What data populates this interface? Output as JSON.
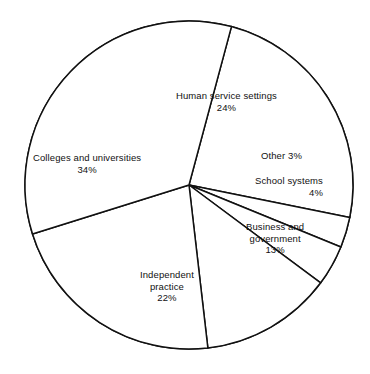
{
  "chart_data": {
    "type": "pie",
    "title": "",
    "subtitle": "",
    "xlabel": "",
    "ylabel": "",
    "legend_position": "none",
    "grid": false,
    "value_unit": "%",
    "total": 100,
    "style": {
      "fill": "#ffffff",
      "stroke": "#111111",
      "stroke_width": 1.5,
      "background": "#ffffff",
      "labels_inside": true
    },
    "geometry": {
      "center_x": 189,
      "center_y": 185,
      "radius": 164,
      "start_angle_deg": -75,
      "direction": "clockwise"
    },
    "categories": [
      "Human service settings",
      "Other",
      "School systems",
      "Business and government",
      "Independent practice",
      "Colleges and universities"
    ],
    "values": [
      24,
      3,
      4,
      13,
      22,
      34
    ],
    "slices": [
      {
        "name": "Human service settings",
        "value": 24,
        "value_text": "24%",
        "label_lines": [
          "Human service settings",
          "24%"
        ],
        "start_angle_deg": -75,
        "end_angle_deg": 11.4
      },
      {
        "name": "Other",
        "value": 3,
        "value_text": "3%",
        "label_lines": [
          "Other 3%"
        ],
        "start_angle_deg": 11.4,
        "end_angle_deg": 22.2
      },
      {
        "name": "School systems",
        "value": 4,
        "value_text": "4%",
        "label_lines": [
          "School systems",
          "4%"
        ],
        "start_angle_deg": 22.2,
        "end_angle_deg": 36.6
      },
      {
        "name": "Business and government",
        "value": 13,
        "value_text": "13%",
        "label_lines": [
          "Business and",
          "government",
          "13%"
        ],
        "start_angle_deg": 36.6,
        "end_angle_deg": 83.4
      },
      {
        "name": "Independent practice",
        "value": 22,
        "value_text": "22%",
        "label_lines": [
          "Independent",
          "practice",
          "22%"
        ],
        "start_angle_deg": 83.4,
        "end_angle_deg": 162.6
      },
      {
        "name": "Colleges and universities",
        "value": 34,
        "value_text": "34%",
        "label_lines": [
          "Colleges and universities",
          "34%"
        ],
        "start_angle_deg": 162.6,
        "end_angle_deg": 285
      }
    ]
  },
  "labels": {
    "human_service": {
      "line1": "Human service settings",
      "line2": "24%"
    },
    "other": {
      "line1": "Other 3%"
    },
    "school_systems": {
      "line1": "School systems",
      "line2": "4%"
    },
    "business_government": {
      "line1": "Business and",
      "line2": "government",
      "line3": "13%"
    },
    "independent_practice": {
      "line1": "Independent",
      "line2": "practice",
      "line3": "22%"
    },
    "colleges_universities": {
      "line1": "Colleges and universities",
      "line2": "34%"
    }
  },
  "caption": {
    "text": ""
  }
}
